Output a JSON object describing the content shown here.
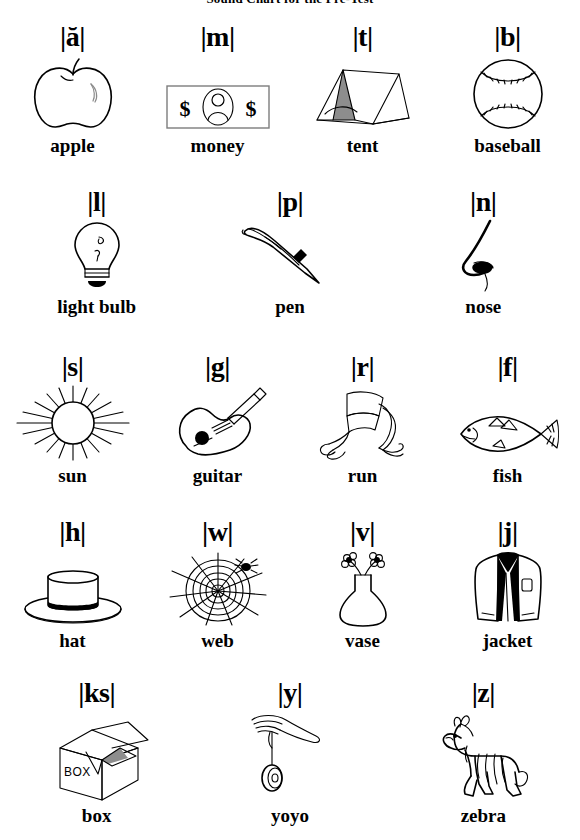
{
  "title": "Sound Chart for the Pre-Test",
  "rows": [
    {
      "id": "row-1",
      "cells": [
        {
          "phoneme": "|ă|",
          "word": "apple",
          "icon": "apple-icon"
        },
        {
          "phoneme": "|m|",
          "word": "money",
          "icon": "money-icon"
        },
        {
          "phoneme": "|t|",
          "word": "tent",
          "icon": "tent-icon"
        },
        {
          "phoneme": "|b|",
          "word": "baseball",
          "icon": "baseball-icon"
        }
      ]
    },
    {
      "id": "row-2",
      "cells": [
        {
          "phoneme": "|l|",
          "word": "light bulb",
          "icon": "light-bulb-icon"
        },
        {
          "phoneme": "|p|",
          "word": "pen",
          "icon": "pen-icon"
        },
        {
          "phoneme": "|n|",
          "word": "nose",
          "icon": "nose-icon"
        }
      ]
    },
    {
      "id": "row-3",
      "cells": [
        {
          "phoneme": "|s|",
          "word": "sun",
          "icon": "sun-icon"
        },
        {
          "phoneme": "|g|",
          "word": "guitar",
          "icon": "guitar-icon"
        },
        {
          "phoneme": "|r|",
          "word": "run",
          "icon": "run-icon"
        },
        {
          "phoneme": "|f|",
          "word": "fish",
          "icon": "fish-icon"
        }
      ]
    },
    {
      "id": "row-4",
      "cells": [
        {
          "phoneme": "|h|",
          "word": "hat",
          "icon": "hat-icon"
        },
        {
          "phoneme": "|w|",
          "word": "web",
          "icon": "web-icon"
        },
        {
          "phoneme": "|v|",
          "word": "vase",
          "icon": "vase-icon"
        },
        {
          "phoneme": "|j|",
          "word": "jacket",
          "icon": "jacket-icon"
        }
      ]
    },
    {
      "id": "row-5",
      "cells": [
        {
          "phoneme": "|ks|",
          "word": "box",
          "icon": "box-icon"
        },
        {
          "phoneme": "|y|",
          "word": "yoyo",
          "icon": "yoyo-icon"
        },
        {
          "phoneme": "|z|",
          "word": "zebra",
          "icon": "zebra-icon"
        }
      ]
    }
  ],
  "art_labels": {
    "bill_symbol_left": "$",
    "bill_symbol_right": "$",
    "box_face_text": "BOX"
  },
  "colors": {
    "ink": "#000000",
    "paper": "#ffffff",
    "gray_line": "#8a8a8a",
    "shade": "#8d8d8d"
  }
}
